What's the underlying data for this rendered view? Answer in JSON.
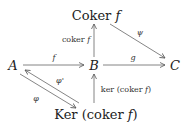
{
  "diagram": {
    "type": "commutative-diagram",
    "nodes": {
      "A": {
        "label": "A"
      },
      "B": {
        "label": "B"
      },
      "C": {
        "label": "C"
      },
      "coker": {
        "label_main": "Coker ",
        "label_var": "f"
      },
      "ker": {
        "label_main": "Ker (coker ",
        "label_var": "f",
        "label_end": ")"
      }
    },
    "edges": [
      {
        "from": "A",
        "to": "B",
        "label": "f"
      },
      {
        "from": "B",
        "to": "C",
        "label": "g"
      },
      {
        "from": "B",
        "to": "coker",
        "label_main": "coker ",
        "label_var": "f"
      },
      {
        "from": "coker",
        "to": "C",
        "label": "ψ"
      },
      {
        "from": "ker",
        "to": "B",
        "label_main": "ker (coker ",
        "label_var": "f",
        "label_end": ")"
      },
      {
        "from": "ker",
        "to": "A",
        "label": "φ'"
      },
      {
        "from": "A",
        "to": "ker",
        "label": "φ"
      }
    ],
    "colors": {
      "stroke": "#555555",
      "text": "#222222"
    }
  }
}
